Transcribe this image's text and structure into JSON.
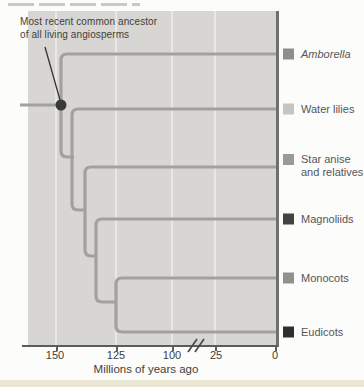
{
  "figure": {
    "annotation_line1": "Most recent common ancestor",
    "annotation_line2": "of all living angiosperms"
  },
  "taxa": [
    {
      "name": "Amborella",
      "swatch": "#8e8e8c"
    },
    {
      "name": "Water lilies",
      "swatch": "#c6c5c1"
    },
    {
      "name": "Star anise and relatives",
      "swatch": "#9b9a96"
    },
    {
      "name": "Magnoliids",
      "swatch": "#434341"
    },
    {
      "name": "Monocots",
      "swatch": "#90908c"
    },
    {
      "name": "Eudicots",
      "swatch": "#2f2f2d"
    }
  ],
  "axis": {
    "tick_labels": [
      "150",
      "125",
      "100",
      "25",
      "0"
    ],
    "title": "Millions of years ago",
    "has_break": true
  },
  "tree": {
    "tip_order_top_to_bottom": [
      "Amborella",
      "Water lilies",
      "Star anise and relatives",
      "Magnoliids",
      "Monocots",
      "Eudicots"
    ],
    "root_annotation": "Most recent common ancestor of all living angiosperms"
  },
  "colors": {
    "branch": "#a2a19d",
    "panel_bg": "#d7d6d2",
    "node_dot": "#3a3a38",
    "axis_line": "#5c5c5a",
    "text": "#3f3f3d",
    "label_text": "#55565a",
    "page_bottom_strip": "#eae6d4"
  }
}
